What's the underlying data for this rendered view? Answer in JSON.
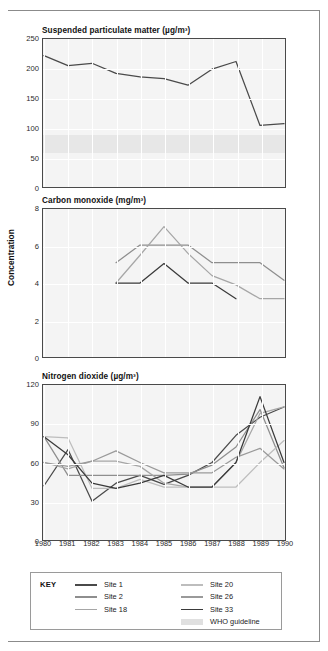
{
  "figure": {
    "y_axis_label": "Concentration",
    "x_tick_labels": [
      "1980",
      "1981",
      "1982",
      "1983",
      "1984",
      "1985",
      "1986",
      "1987",
      "1988",
      "1989",
      "1990"
    ]
  },
  "legend": {
    "key_label": "KEY",
    "entries": [
      {
        "label": "Site 1",
        "color": "#4a4a4a",
        "type": "line"
      },
      {
        "label": "Site 2",
        "color": "#8e8e8e",
        "type": "line"
      },
      {
        "label": "Site 18",
        "color": "#a6a6a6",
        "type": "line"
      },
      {
        "label": "Site 20",
        "color": "#bdbdbd",
        "type": "line"
      },
      {
        "label": "Site 26",
        "color": "#9a9a9a",
        "type": "line"
      },
      {
        "label": "Site 33",
        "color": "#3a3a3a",
        "type": "line"
      },
      {
        "label": "WHO guideline",
        "color": "#e0e0e0",
        "type": "band"
      }
    ]
  },
  "chart_data": [
    {
      "id": "spm",
      "type": "line",
      "title": "Suspended particulate matter (µg/m³)",
      "xlabel": "",
      "ylabel": "",
      "x": [
        "1980",
        "1981",
        "1982",
        "1983",
        "1984",
        "1985",
        "1986",
        "1987",
        "1988",
        "1989",
        "1990"
      ],
      "ylim": [
        0,
        250
      ],
      "yticks": [
        0,
        50,
        100,
        150,
        200,
        250
      ],
      "grid": true,
      "who_guideline_band": [
        60,
        90
      ],
      "series": [
        {
          "name": "Site 1",
          "color": "#4a4a4a",
          "values": [
            222,
            205,
            209,
            192,
            186,
            183,
            172,
            199,
            212,
            104,
            107
          ]
        }
      ]
    },
    {
      "id": "co",
      "type": "line",
      "title": "Carbon monoxide (mg/m³)",
      "xlabel": "",
      "ylabel": "Concentration",
      "x": [
        "1980",
        "1981",
        "1982",
        "1983",
        "1984",
        "1985",
        "1986",
        "1987",
        "1988",
        "1989",
        "1990"
      ],
      "ylim": [
        0,
        8
      ],
      "yticks": [
        0,
        2,
        4,
        6,
        8
      ],
      "grid": true,
      "series": [
        {
          "name": "Site 2",
          "color": "#8e8e8e",
          "values": [
            null,
            null,
            null,
            5.1,
            6.05,
            6.05,
            6.05,
            5.1,
            5.1,
            5.1,
            4.15
          ]
        },
        {
          "name": "Site 18",
          "color": "#a6a6a6",
          "values": [
            null,
            null,
            null,
            4.0,
            5.5,
            7.05,
            5.6,
            4.4,
            3.9,
            3.15,
            3.15
          ]
        },
        {
          "name": "Site 33",
          "color": "#3a3a3a",
          "values": [
            null,
            null,
            null,
            4.0,
            4.0,
            5.05,
            4.0,
            4.0,
            3.15,
            null,
            null
          ]
        }
      ]
    },
    {
      "id": "no2",
      "type": "line",
      "title": "Nitrogen dioxide (µg/m³)",
      "xlabel": "",
      "ylabel": "",
      "x": [
        "1980",
        "1981",
        "1982",
        "1983",
        "1984",
        "1985",
        "1986",
        "1987",
        "1988",
        "1989",
        "1990"
      ],
      "ylim": [
        0,
        120
      ],
      "yticks": [
        0,
        30,
        60,
        90,
        120
      ],
      "grid": true,
      "series": [
        {
          "name": "Site 1",
          "color": "#4a4a4a",
          "values": [
            42,
            70,
            30,
            44,
            50,
            43,
            50,
            60,
            81,
            95,
            103
          ]
        },
        {
          "name": "Site 2",
          "color": "#8e8e8e",
          "values": [
            80,
            50,
            50,
            50,
            50,
            50,
            51,
            58,
            72,
            101,
            56
          ]
        },
        {
          "name": "Site 18",
          "color": "#a6a6a6",
          "values": [
            60,
            55,
            61,
            61,
            57,
            44,
            41,
            41,
            60,
            98,
            103
          ]
        },
        {
          "name": "Site 20",
          "color": "#bdbdbd",
          "values": [
            80,
            79,
            40,
            40,
            47,
            41,
            41,
            41,
            41,
            60,
            77
          ]
        },
        {
          "name": "Site 26",
          "color": "#9a9a9a",
          "values": [
            60,
            57,
            61,
            69,
            60,
            52,
            52,
            52,
            64,
            71,
            55
          ]
        },
        {
          "name": "Site 33",
          "color": "#3a3a3a",
          "values": [
            80,
            66,
            44,
            40,
            44,
            50,
            41,
            41,
            60,
            111,
            60
          ]
        }
      ]
    }
  ]
}
